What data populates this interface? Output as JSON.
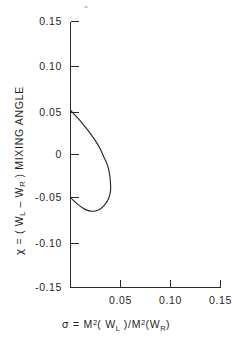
{
  "figure": {
    "background_color": "#ffffff",
    "ink_color": "#262626"
  },
  "chart_data": {
    "type": "line",
    "title": "",
    "xlabel": "σ = M²(W_L)/M²(W_R)",
    "ylabel": "χ = (W_L − W_R) MIXING ANGLE",
    "xlim": [
      0.0,
      0.15
    ],
    "ylim": [
      -0.15,
      0.15
    ],
    "grid": false,
    "legend": null,
    "xticks": [
      0.0,
      0.05,
      0.1,
      0.15
    ],
    "xtick_labels": [
      "",
      "0.05",
      "0.10",
      "0.15"
    ],
    "yticks": [
      -0.15,
      -0.1,
      -0.05,
      0.0,
      0.05,
      0.1,
      0.15
    ],
    "ytick_labels": [
      "-0.15",
      "-0.10",
      "-0.05",
      "0",
      "0.05",
      "0.10",
      "0.15"
    ],
    "series": [
      {
        "name": "allowed-region-boundary",
        "closed": true,
        "description": "teardrop-shaped closed contour opening onto the chi axis",
        "points": [
          [
            0.0,
            0.05
          ],
          [
            0.004,
            0.045
          ],
          [
            0.009,
            0.039
          ],
          [
            0.014,
            0.032
          ],
          [
            0.019,
            0.025
          ],
          [
            0.024,
            0.017
          ],
          [
            0.029,
            0.008
          ],
          [
            0.033,
            -0.002
          ],
          [
            0.037,
            -0.012
          ],
          [
            0.039,
            -0.022
          ],
          [
            0.04,
            -0.032
          ],
          [
            0.04,
            -0.041
          ],
          [
            0.038,
            -0.05
          ],
          [
            0.034,
            -0.057
          ],
          [
            0.029,
            -0.062
          ],
          [
            0.023,
            -0.064
          ],
          [
            0.017,
            -0.063
          ],
          [
            0.012,
            -0.06
          ],
          [
            0.007,
            -0.056
          ],
          [
            0.003,
            -0.052
          ],
          [
            0.0,
            -0.048
          ]
        ]
      }
    ],
    "annotations": []
  },
  "axes": {
    "x_axis_name": "sigma-axis",
    "y_axis_name": "chi-axis",
    "xlabel_parts": {
      "symbol": "σ",
      "equals": "=",
      "numerator_base": "M",
      "numerator_exp": "2",
      "numerator_arg_open": "( W",
      "numerator_arg_sub": "L",
      "numerator_arg_close": " )",
      "slash": "/",
      "denominator_base": "M",
      "denominator_exp": "2",
      "denominator_arg_open": "(W",
      "denominator_arg_sub": "R",
      "denominator_arg_close": ")"
    },
    "ylabel_parts": {
      "symbol": "χ",
      "equals": "=",
      "open": "( W",
      "sub_left": "L",
      "minus": " – W",
      "sub_right": "R",
      "close": " )",
      "tail": "MIXING  ANGLE"
    }
  }
}
